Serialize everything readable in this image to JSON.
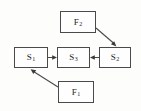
{
  "diagram": {
    "background_color": "#fdfdfc",
    "stroke_color": "#4a4a4a",
    "text_color": "#1d1d1d",
    "width": 141,
    "height": 111,
    "nodes": [
      {
        "id": "S1",
        "label_base": "S",
        "label_sub": "1",
        "label_full": "S1",
        "x": 14,
        "y": 47,
        "w": 34,
        "h": 21
      },
      {
        "id": "S3",
        "label_base": "S",
        "label_sub": "3",
        "label_full": "S3",
        "x": 57,
        "y": 47,
        "w": 33,
        "h": 21
      },
      {
        "id": "S2",
        "label_base": "S",
        "label_sub": "2",
        "label_full": "S2",
        "x": 99,
        "y": 47,
        "w": 32,
        "h": 21
      },
      {
        "id": "F2",
        "label_base": "F",
        "label_sub": "2",
        "label_full": "F2",
        "x": 60,
        "y": 11,
        "w": 36,
        "h": 22
      },
      {
        "id": "F1",
        "label_base": "F",
        "label_sub": "1",
        "label_full": "F1",
        "x": 58,
        "y": 81,
        "w": 36,
        "h": 22
      }
    ],
    "edges": [
      {
        "id": "edge-s1-s3",
        "from": "S1",
        "to": "S3",
        "kind": "horizontal",
        "direction": "right"
      },
      {
        "id": "edge-s2-s3",
        "from": "S2",
        "to": "S3",
        "kind": "horizontal",
        "direction": "left"
      },
      {
        "id": "edge-f2-s2",
        "from": "F2",
        "to": "S2",
        "kind": "diagonal",
        "direction": "down-right"
      },
      {
        "id": "edge-f1-s1",
        "from": "F1",
        "to": "S1",
        "kind": "diagonal",
        "direction": "up-left"
      }
    ]
  }
}
